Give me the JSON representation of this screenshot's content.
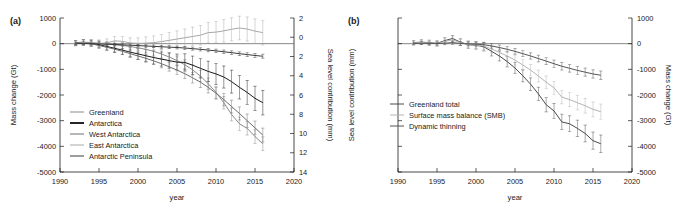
{
  "figure": {
    "panels": [
      {
        "label": "(a)",
        "xaxis": {
          "title": "year",
          "min": 1990,
          "max": 2020,
          "ticks": [
            1990,
            1995,
            2000,
            2005,
            2010,
            2015,
            2020
          ]
        },
        "yaxis_left": {
          "title": "Mass change (Gt)",
          "min": -5000,
          "max": 1000,
          "ticks": [
            1000,
            0,
            -1000,
            -2000,
            -3000,
            -4000,
            -5000
          ]
        },
        "yaxis_right": {
          "title": "Sea level contribution (mm)",
          "min": -2,
          "max": 14,
          "ticks": [
            2,
            0,
            2,
            4,
            6,
            8,
            10,
            12,
            14
          ],
          "tick_values": [
            -2,
            0,
            2,
            4,
            6,
            8,
            10,
            12,
            14
          ]
        }
      },
      {
        "label": "(b)",
        "xaxis": {
          "title": "year",
          "min": 1990,
          "max": 2020,
          "ticks": [
            1990,
            1995,
            2000,
            2005,
            2010,
            2015,
            2020
          ]
        },
        "yaxis_left": {
          "title": "Sea level contribution (mm)",
          "min": -5000,
          "max": 1000,
          "ticks": []
        },
        "yaxis_right": {
          "title": "Mass change (Gt)",
          "min": -5000,
          "max": 1000,
          "ticks": [
            1000,
            0,
            -1000,
            -2000,
            -3000,
            -4000,
            -5000
          ]
        }
      }
    ]
  },
  "chart_data": [
    {
      "type": "line",
      "panel": "(a)",
      "title": "",
      "xlabel": "year",
      "ylabel": "Mass change (Gt)",
      "ylabel_right": "Sea level contribution (mm)",
      "xlim": [
        1990,
        2020
      ],
      "ylim": [
        -5000,
        1000
      ],
      "ylim_right": [
        -2,
        14
      ],
      "grid": false,
      "legend_position": "lower-left",
      "x": [
        1992,
        1993,
        1994,
        1995,
        1996,
        1997,
        1998,
        1999,
        2000,
        2001,
        2002,
        2003,
        2004,
        2005,
        2006,
        2007,
        2008,
        2009,
        2010,
        2011,
        2012,
        2013,
        2014,
        2015,
        2016
      ],
      "series": [
        {
          "name": "Greenland",
          "color": "#8a8a8a",
          "width": 1.0,
          "values": [
            40,
            60,
            40,
            10,
            -20,
            -40,
            -70,
            -110,
            -160,
            -220,
            -300,
            -400,
            -520,
            -660,
            -820,
            -1020,
            -1260,
            -1560,
            -1900,
            -2300,
            -2760,
            -3120,
            -3300,
            -3620,
            -3900
          ],
          "errors": [
            90,
            90,
            95,
            100,
            105,
            110,
            115,
            120,
            130,
            140,
            150,
            160,
            170,
            180,
            190,
            200,
            210,
            220,
            230,
            240,
            250,
            255,
            260,
            265,
            270
          ]
        },
        {
          "name": "Antarctica",
          "color": "#1a1a1a",
          "width": 1.9,
          "values": [
            30,
            50,
            20,
            -40,
            -110,
            -180,
            -250,
            -330,
            -400,
            -470,
            -540,
            -600,
            -660,
            -720,
            -730,
            -840,
            -960,
            -1080,
            -1180,
            -1300,
            -1480,
            -1700,
            -1900,
            -2130,
            -2300
          ],
          "errors": [
            100,
            110,
            120,
            135,
            150,
            165,
            180,
            195,
            215,
            235,
            255,
            275,
            295,
            315,
            335,
            355,
            375,
            395,
            415,
            430,
            445,
            455,
            465,
            470,
            475
          ]
        },
        {
          "name": "West Antarctica",
          "color": "#6e6e6e",
          "width": 1.0,
          "values": [
            10,
            20,
            -10,
            -70,
            -140,
            -215,
            -300,
            -390,
            -480,
            -570,
            -670,
            -780,
            -900,
            -1030,
            -1170,
            -1330,
            -1500,
            -1700,
            -1930,
            -2180,
            -2450,
            -2720,
            -3000,
            -3280,
            -3560
          ],
          "errors": [
            70,
            75,
            80,
            88,
            96,
            104,
            112,
            120,
            130,
            140,
            150,
            160,
            170,
            180,
            190,
            200,
            210,
            220,
            230,
            240,
            248,
            254,
            260,
            265,
            270
          ]
        },
        {
          "name": "East Antarctica",
          "color": "#a8a8a8",
          "width": 1.0,
          "values": [
            20,
            40,
            30,
            10,
            30,
            110,
            90,
            30,
            10,
            20,
            40,
            80,
            130,
            180,
            230,
            280,
            330,
            430,
            450,
            500,
            560,
            610,
            570,
            490,
            430
          ],
          "errors": [
            110,
            115,
            125,
            140,
            155,
            170,
            185,
            200,
            220,
            240,
            260,
            280,
            300,
            320,
            340,
            360,
            380,
            400,
            420,
            435,
            450,
            460,
            470,
            475,
            480
          ]
        },
        {
          "name": "Antarctic Peninsula",
          "color": "#3a3a3a",
          "width": 1.0,
          "values": [
            0,
            5,
            0,
            -10,
            -20,
            -30,
            -45,
            -60,
            -75,
            -90,
            -105,
            -120,
            -135,
            -150,
            -170,
            -195,
            -220,
            -250,
            -280,
            -315,
            -350,
            -390,
            -425,
            -460,
            -490
          ],
          "errors": [
            30,
            32,
            34,
            36,
            38,
            40,
            42,
            44,
            46,
            48,
            50,
            52,
            54,
            56,
            58,
            60,
            62,
            64,
            66,
            68,
            70,
            72,
            74,
            76,
            78
          ]
        }
      ]
    },
    {
      "type": "line",
      "panel": "(b)",
      "title": "",
      "xlabel": "year",
      "ylabel": "Sea level contribution (mm)",
      "ylabel_right": "Mass change (Gt)",
      "xlim": [
        1990,
        2020
      ],
      "ylim": [
        -5000,
        1000
      ],
      "grid": false,
      "legend_position": "center-left",
      "x": [
        1992,
        1993,
        1994,
        1995,
        1996,
        1997,
        1998,
        1999,
        2000,
        2001,
        2002,
        2003,
        2004,
        2005,
        2006,
        2007,
        2008,
        2009,
        2010,
        2011,
        2012,
        2013,
        2014,
        2015,
        2016
      ],
      "series": [
        {
          "name": "Greenland total",
          "color": "#4a4a4a",
          "width": 1.0,
          "values": [
            40,
            60,
            40,
            10,
            120,
            200,
            60,
            -40,
            -60,
            -120,
            -300,
            -480,
            -700,
            -950,
            -1250,
            -1580,
            -1960,
            -2380,
            -2620,
            -3050,
            -3120,
            -3300,
            -3500,
            -3780,
            -3900
          ],
          "errors": [
            90,
            92,
            96,
            102,
            112,
            122,
            130,
            140,
            152,
            164,
            178,
            192,
            206,
            220,
            234,
            248,
            262,
            276,
            290,
            300,
            310,
            318,
            326,
            334,
            340
          ]
        },
        {
          "name": "Surface mass balance (SMB)",
          "color": "#b4b4b4",
          "width": 1.0,
          "values": [
            30,
            45,
            30,
            0,
            90,
            150,
            40,
            -30,
            -50,
            -90,
            -210,
            -340,
            -480,
            -640,
            -830,
            -1030,
            -1260,
            -1500,
            -1720,
            -2080,
            -2180,
            -2300,
            -2420,
            -2560,
            -2650
          ],
          "errors": [
            80,
            82,
            86,
            92,
            100,
            110,
            118,
            126,
            136,
            146,
            158,
            170,
            182,
            194,
            206,
            218,
            230,
            242,
            254,
            262,
            270,
            278,
            284,
            290,
            296
          ]
        },
        {
          "name": "Dynamic thinning",
          "color": "#555555",
          "width": 1.0,
          "values": [
            10,
            15,
            10,
            5,
            20,
            40,
            10,
            -10,
            -20,
            -40,
            -90,
            -150,
            -220,
            -300,
            -390,
            -480,
            -580,
            -680,
            -780,
            -880,
            -960,
            -1040,
            -1110,
            -1180,
            -1230
          ],
          "errors": [
            50,
            52,
            54,
            58,
            62,
            66,
            70,
            74,
            80,
            86,
            92,
            98,
            104,
            110,
            116,
            122,
            128,
            134,
            140,
            146,
            150,
            154,
            158,
            162,
            166
          ]
        }
      ]
    }
  ]
}
